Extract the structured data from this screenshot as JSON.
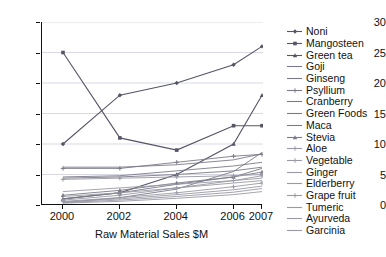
{
  "chart_data": {
    "type": "line",
    "title": "",
    "xlabel": "Raw Material Sales $M",
    "ylabel": "",
    "x": [
      2000,
      2002,
      2004,
      2006,
      2007
    ],
    "xtick_labels": [
      "2000",
      "2002",
      "2004",
      "2006",
      "2007"
    ],
    "ytick_labels": [
      "0",
      "5",
      "10",
      "15",
      "20",
      "25",
      "30"
    ],
    "ylim": [
      0,
      30
    ],
    "ytick_values": [
      0,
      5,
      10,
      15,
      20,
      25,
      30
    ],
    "grid": "horizontal",
    "legend_position": "right",
    "series": [
      {
        "name": "Noni",
        "marker": "diamond",
        "values": [
          10,
          18,
          20,
          23,
          26
        ]
      },
      {
        "name": "Mangosteen",
        "marker": "square",
        "values": [
          25,
          11,
          9,
          13,
          13
        ]
      },
      {
        "name": "Green tea",
        "marker": "triangle",
        "values": [
          1,
          2,
          5,
          10,
          18
        ]
      },
      {
        "name": "Goji",
        "marker": "line",
        "values": [
          0.4,
          1.2,
          2.6,
          5.5,
          8.6
        ]
      },
      {
        "name": "Ginseng",
        "marker": "line",
        "values": [
          6.2,
          6.2,
          6.6,
          7.4,
          8.4
        ]
      },
      {
        "name": "Psyllium",
        "marker": "cross",
        "values": [
          6.0,
          6.0,
          7.0,
          8.0,
          8.3
        ]
      },
      {
        "name": "Cranberry",
        "marker": "line",
        "values": [
          4.6,
          4.8,
          5.6,
          6.4,
          7.0
        ]
      },
      {
        "name": "Green Foods",
        "marker": "line",
        "values": [
          4.4,
          4.6,
          5.0,
          5.6,
          6.2
        ]
      },
      {
        "name": "Maca",
        "marker": "line",
        "values": [
          1.0,
          2.0,
          3.4,
          4.6,
          6.0
        ]
      },
      {
        "name": "Stevia",
        "marker": "triangle",
        "values": [
          1.6,
          2.4,
          3.6,
          4.6,
          5.4
        ]
      },
      {
        "name": "Aloe",
        "marker": "cross",
        "values": [
          4.2,
          4.4,
          4.6,
          4.8,
          5.0
        ]
      },
      {
        "name": "Vegetable",
        "marker": "cross",
        "values": [
          0.8,
          1.6,
          2.8,
          4.0,
          4.8
        ]
      },
      {
        "name": "Ginger",
        "marker": "line",
        "values": [
          2.2,
          2.8,
          3.4,
          4.0,
          4.4
        ]
      },
      {
        "name": "Elderberry",
        "marker": "line",
        "values": [
          1.4,
          2.0,
          2.8,
          3.6,
          4.0
        ]
      },
      {
        "name": "Grape fruit",
        "marker": "cross",
        "values": [
          0.6,
          1.2,
          2.0,
          3.0,
          3.6
        ]
      },
      {
        "name": "Tumeric",
        "marker": "line",
        "values": [
          0.5,
          1.0,
          1.7,
          2.5,
          3.1
        ]
      },
      {
        "name": "Ayurveda",
        "marker": "line",
        "values": [
          0.4,
          0.8,
          1.4,
          2.1,
          2.7
        ]
      },
      {
        "name": "Garcinia",
        "marker": "line",
        "values": [
          0.3,
          0.6,
          1.1,
          1.7,
          2.2
        ]
      }
    ],
    "colors": {
      "axis": "#111111",
      "grid": "#d9d9e6",
      "line_dark": "#555566",
      "line_mid": "#7a7a88",
      "line_light": "#9a9aa6"
    }
  }
}
